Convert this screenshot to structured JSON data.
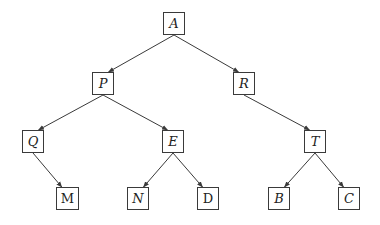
{
  "diagram": {
    "type": "tree",
    "colors": {
      "stroke": "#3a3a3a",
      "text": "#222222",
      "background": "#ffffff"
    },
    "nodes": [
      {
        "id": "A",
        "label": "A",
        "italic": true,
        "x": 163,
        "y": 12,
        "w": 22,
        "h": 23
      },
      {
        "id": "P",
        "label": "P",
        "italic": true,
        "x": 92,
        "y": 72,
        "w": 22,
        "h": 23
      },
      {
        "id": "R",
        "label": "R",
        "italic": true,
        "x": 233,
        "y": 72,
        "w": 22,
        "h": 23
      },
      {
        "id": "Q",
        "label": "Q",
        "italic": true,
        "x": 22,
        "y": 130,
        "w": 22,
        "h": 23
      },
      {
        "id": "E",
        "label": "E",
        "italic": true,
        "x": 162,
        "y": 130,
        "w": 22,
        "h": 23
      },
      {
        "id": "T",
        "label": "T",
        "italic": true,
        "x": 304,
        "y": 130,
        "w": 22,
        "h": 23
      },
      {
        "id": "M",
        "label": "M",
        "italic": false,
        "x": 56,
        "y": 187,
        "w": 23,
        "h": 23
      },
      {
        "id": "N",
        "label": "N",
        "italic": true,
        "x": 127,
        "y": 187,
        "w": 22,
        "h": 23
      },
      {
        "id": "D",
        "label": "D",
        "italic": false,
        "x": 197,
        "y": 187,
        "w": 22,
        "h": 23
      },
      {
        "id": "B",
        "label": "B",
        "italic": true,
        "x": 268,
        "y": 187,
        "w": 22,
        "h": 23
      },
      {
        "id": "C",
        "label": "C",
        "italic": true,
        "x": 338,
        "y": 187,
        "w": 22,
        "h": 23
      }
    ],
    "edges": [
      {
        "from": "A",
        "to": "P"
      },
      {
        "from": "A",
        "to": "R"
      },
      {
        "from": "P",
        "to": "Q"
      },
      {
        "from": "P",
        "to": "E"
      },
      {
        "from": "Q",
        "to": "M"
      },
      {
        "from": "E",
        "to": "N"
      },
      {
        "from": "E",
        "to": "D"
      },
      {
        "from": "R",
        "to": "T"
      },
      {
        "from": "T",
        "to": "B"
      },
      {
        "from": "T",
        "to": "C"
      }
    ]
  }
}
